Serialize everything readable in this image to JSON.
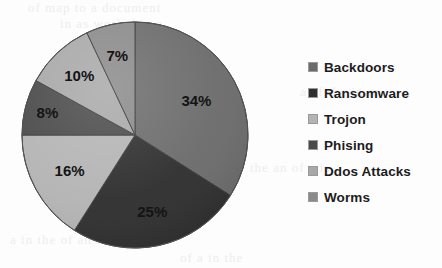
{
  "chart_data": {
    "type": "pie",
    "title": "",
    "labels": [
      "Backdoors",
      "Ransomware",
      "Trojon",
      "Phising",
      "Ddos Attacks",
      "Worms"
    ],
    "values": [
      34,
      25,
      16,
      8,
      10,
      7
    ],
    "data_labels": [
      "34%",
      "25%",
      "16%",
      "8%",
      "10%",
      "7%"
    ],
    "colors": [
      "#6b6b6b",
      "#2e2e2e",
      "#b4b4b4",
      "#4a4a4a",
      "#a8a8a8",
      "#8a8a8a"
    ],
    "start_angle_deg": 0,
    "direction": "clockwise",
    "legend_position": "right",
    "grid": false,
    "unit": "percent"
  },
  "legend": {
    "items": [
      {
        "label": "Backdoors",
        "color": "#6b6b6b"
      },
      {
        "label": "Ransomware",
        "color": "#2e2e2e"
      },
      {
        "label": "Trojon",
        "color": "#b4b4b4"
      },
      {
        "label": "Phising",
        "color": "#4a4a4a"
      },
      {
        "label": "Ddos Attacks",
        "color": "#a8a8a8"
      },
      {
        "label": "Worms",
        "color": "#8a8a8a"
      }
    ]
  },
  "slice_labels": {
    "backdoors": "34%",
    "ransomware": "25%",
    "trojon": "16%",
    "phising": "8%",
    "ddos_attacks": "10%",
    "worms": "7%"
  },
  "background": {
    "ghost_lines": [
      "of map to  a document",
      "in  as work  d  in  a",
      "a  of  the  in  re",
      "the  an  of  a  is",
      "a  in  the  of  an  as",
      "of  a  in  the"
    ]
  }
}
